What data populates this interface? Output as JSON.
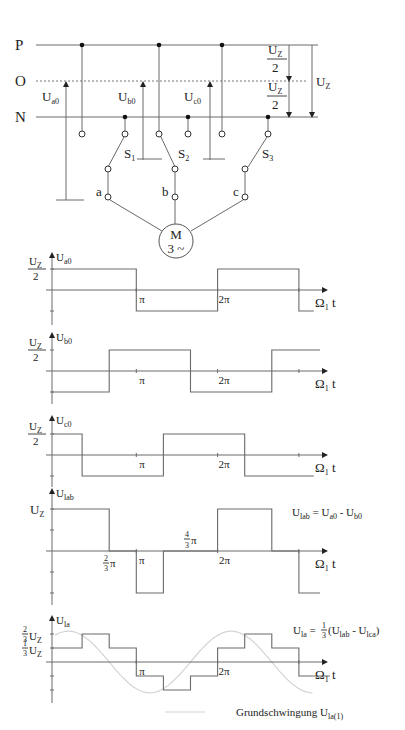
{
  "circuit": {
    "rails": [
      {
        "label": "P",
        "y": 45,
        "style": "solid"
      },
      {
        "label": "O",
        "y": 80,
        "style": "dashed"
      },
      {
        "label": "N",
        "y": 117,
        "style": "solid"
      }
    ],
    "phase_voltages": [
      {
        "label": "U",
        "sub": "a0",
        "x": 66
      },
      {
        "label": "U",
        "sub": "b0",
        "x": 143
      },
      {
        "label": "U",
        "sub": "c0",
        "x": 210
      }
    ],
    "dc_labels": {
      "half_top": {
        "num": "U",
        "num_sub": "Z",
        "den": "2"
      },
      "half_bottom": {
        "num": "U",
        "num_sub": "Z",
        "den": "2"
      },
      "full": {
        "label": "U",
        "sub": "Z"
      }
    },
    "switches": [
      {
        "label": "S",
        "sub": "1"
      },
      {
        "label": "S",
        "sub": "2"
      },
      {
        "label": "S",
        "sub": "3"
      }
    ],
    "terminals": [
      "a",
      "b",
      "c"
    ],
    "motor": {
      "line1": "M",
      "line2": "3 ~"
    }
  },
  "chart_data": [
    {
      "type": "line",
      "title": "U_a0",
      "ylabel": "U_a0",
      "xlabel": "Ω1 t",
      "y_tick_label": "U_Z/2",
      "x_ticks": [
        "π",
        "2π"
      ],
      "steps": [
        [
          0,
          1
        ],
        [
          3.1416,
          -1
        ],
        [
          6.2832,
          1
        ],
        [
          9.4248,
          -1
        ],
        [
          10.0,
          -1
        ]
      ],
      "levels": {
        "high": "U_Z/2",
        "low": "-U_Z/2"
      }
    },
    {
      "type": "line",
      "title": "U_b0",
      "ylabel": "U_b0",
      "xlabel": "Ω1 t",
      "y_tick_label": "U_Z/2",
      "x_ticks": [
        "π",
        "2π"
      ],
      "steps": [
        [
          0,
          -1
        ],
        [
          2.0944,
          1
        ],
        [
          5.236,
          -1
        ],
        [
          8.3776,
          1
        ],
        [
          10.0,
          1
        ]
      ],
      "levels": {
        "high": "U_Z/2",
        "low": "-U_Z/2"
      }
    },
    {
      "type": "line",
      "title": "U_c0",
      "ylabel": "U_c0",
      "xlabel": "Ω1 t",
      "y_tick_label": "U_Z/2",
      "x_ticks": [
        "π",
        "2π"
      ],
      "steps": [
        [
          0,
          1
        ],
        [
          1.0472,
          -1
        ],
        [
          4.1888,
          1
        ],
        [
          7.3304,
          -1
        ],
        [
          10.0,
          -1
        ]
      ],
      "levels": {
        "high": "U_Z/2",
        "low": "-U_Z/2"
      }
    },
    {
      "type": "line",
      "title": "U_lab",
      "ylabel": "U_lab",
      "xlabel": "Ω1 t",
      "y_tick_label": "U_Z",
      "x_ticks": [
        "2/3 π",
        "π",
        "4/3 π",
        "2π"
      ],
      "steps": [
        [
          0,
          1
        ],
        [
          2.0944,
          0
        ],
        [
          3.1416,
          -1
        ],
        [
          4.1888,
          0
        ],
        [
          6.2832,
          1
        ],
        [
          8.3776,
          0
        ],
        [
          9.4248,
          -1
        ],
        [
          10.0,
          -1
        ]
      ],
      "annotation": "U_lab = U_a0 - U_b0",
      "levels": {
        "high": "U_Z",
        "low": "-U_Z"
      }
    },
    {
      "type": "line",
      "title": "U_la",
      "ylabel": "U_la",
      "xlabel": "Ω1 t",
      "y_tick_labels": [
        "2/3 U_Z",
        "1/3 U_Z"
      ],
      "x_ticks": [
        "π",
        "2π"
      ],
      "steps": [
        [
          0,
          1
        ],
        [
          1.0472,
          2
        ],
        [
          2.0944,
          1
        ],
        [
          3.1416,
          -1
        ],
        [
          4.1888,
          -2
        ],
        [
          5.236,
          -1
        ],
        [
          6.2832,
          1
        ],
        [
          7.3304,
          2
        ],
        [
          8.3776,
          1
        ],
        [
          9.4248,
          -1
        ],
        [
          10.0,
          -1
        ]
      ],
      "annotation": "U_la = 1/3 (U_lab - U_lca)",
      "legend": "Grundschwingung U_la(1)",
      "levels": {
        "unit": "1/3 U_Z"
      }
    }
  ],
  "text": {
    "omega_t": "Ω",
    "omega_sub": "1",
    "t": " t",
    "pi": "π",
    "two_pi": "2π",
    "lab_eq": "U",
    "lab_eq_sub": "lab",
    "lab_eq_rest": " = U",
    "lab_eq_sub2": "a0",
    "lab_eq_rest2": " - U",
    "lab_eq_sub3": "b0",
    "la_eq": "U",
    "la_eq_sub": "la",
    "la_eq_rest": " =",
    "la_frac_num": "1",
    "la_frac_den": "3",
    "la_eq_paren": " (U",
    "la_eq_sub2": "lab",
    "la_eq_mid": " - U",
    "la_eq_sub3": "lca",
    "la_eq_end": ")",
    "legend_label": "Grundschwingung  U",
    "legend_sub": "la(1)"
  }
}
